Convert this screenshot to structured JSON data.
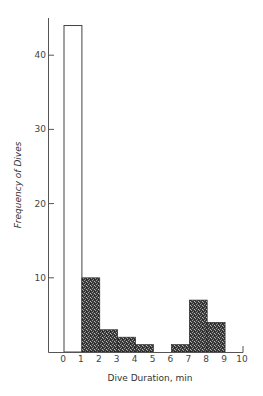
{
  "chart_data": {
    "type": "bar",
    "subtype": "histogram",
    "title": "",
    "xlabel": "Dive Duration, min",
    "ylabel": "Frequency of Dives",
    "bins": [
      {
        "range": [
          0,
          1
        ],
        "value": 44,
        "style": "open"
      },
      {
        "range": [
          1,
          2
        ],
        "value": 10,
        "style": "stippled"
      },
      {
        "range": [
          2,
          3
        ],
        "value": 3,
        "style": "stippled"
      },
      {
        "range": [
          3,
          4
        ],
        "value": 2,
        "style": "stippled"
      },
      {
        "range": [
          4,
          5
        ],
        "value": 1,
        "style": "stippled"
      },
      {
        "range": [
          5,
          6
        ],
        "value": 0,
        "style": "stippled"
      },
      {
        "range": [
          6,
          7
        ],
        "value": 1,
        "style": "stippled"
      },
      {
        "range": [
          7,
          8
        ],
        "value": 7,
        "style": "stippled"
      },
      {
        "range": [
          8,
          9
        ],
        "value": 4,
        "style": "stippled"
      },
      {
        "range": [
          9,
          10
        ],
        "value": 0,
        "style": "stippled"
      }
    ],
    "categories": [
      "0-1",
      "1-2",
      "2-3",
      "3-4",
      "4-5",
      "5-6",
      "6-7",
      "7-8",
      "8-9",
      "9-10"
    ],
    "values": [
      44,
      10,
      3,
      2,
      1,
      0,
      1,
      7,
      4,
      0
    ],
    "x_ticks": [
      "0",
      "1",
      "2",
      "3",
      "4",
      "5",
      "6",
      "7",
      "8",
      "9",
      "10"
    ],
    "y_ticks": [
      "10",
      "20",
      "30",
      "40"
    ],
    "xlim": [
      0,
      10
    ],
    "ylim": [
      0,
      45
    ],
    "grid": false,
    "legend": null
  },
  "colors": {
    "axis": "#555555",
    "bar_open_fill": "#ffffff",
    "bar_open_stroke": "#444444",
    "bar_stipple_dark": "#2a2a2a",
    "bar_stipple_light": "#8a8a8a"
  }
}
